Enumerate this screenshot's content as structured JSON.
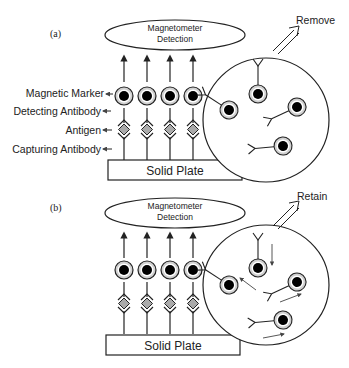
{
  "panels": [
    {
      "id": "a",
      "label": "(a)",
      "detector": {
        "line1": "Magnetometer",
        "line2": "Detection"
      },
      "plate_label": "Solid Plate",
      "action_label": "Remove",
      "annotations": [
        "Magnetic Marker",
        "Detecting Antibody",
        "Antigen",
        "Capturing Antibody"
      ],
      "bound_complexes": 4,
      "free_markers": 4,
      "brownian_motion_arrows": false
    },
    {
      "id": "b",
      "label": "(b)",
      "detector": {
        "line1": "Magnetometer",
        "line2": "Detection"
      },
      "plate_label": "Solid Plate",
      "action_label": "Retain",
      "bound_complexes": 4,
      "free_markers": 4,
      "brownian_motion_arrows": true
    }
  ],
  "colors": {
    "stroke": "#222222",
    "antigen_fill": "#aaaaaa",
    "marker_ring": "#d0d0d0",
    "marker_core": "#000000"
  }
}
